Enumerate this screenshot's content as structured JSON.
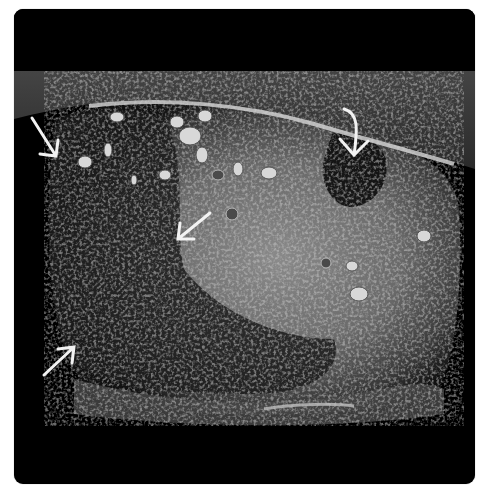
{
  "image": {
    "kind": "ultrasound-scan",
    "background": "#000000",
    "frame_color": "#000000",
    "page_background": "#ffffff",
    "annotation_color": "#f2f2f2"
  },
  "annotations": {
    "arrows": [
      {
        "id": "arrow-upper-left",
        "direction": "down-right",
        "style": "straight"
      },
      {
        "id": "arrow-upper-right",
        "direction": "down",
        "style": "curved"
      },
      {
        "id": "arrow-center",
        "direction": "down-left",
        "style": "straight"
      },
      {
        "id": "arrow-lower-left",
        "direction": "up-right",
        "style": "straight"
      }
    ]
  }
}
